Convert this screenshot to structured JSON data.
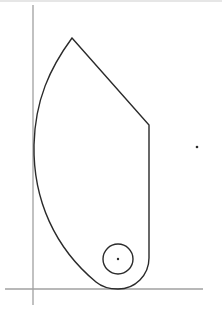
{
  "diagram": {
    "type": "cad-sketch",
    "size": {
      "width": 222,
      "height": 309
    },
    "colors": {
      "background": "#ffffff",
      "axis": "#a0a0a0",
      "geometry": "#2a2a2a",
      "frame": "#e6e6e6"
    },
    "axes": {
      "vertical": {
        "x": 33,
        "y1": 5,
        "y2": 305
      },
      "horizontal": {
        "y": 289,
        "x1": 5,
        "x2": 203
      }
    },
    "profile": {
      "apex": [
        72,
        38
      ],
      "right_line_end": [
        149,
        125
      ],
      "right_edge_bottom": [
        149,
        258
      ],
      "bottom_arc": {
        "center": [
          118,
          258
        ],
        "radius": 31
      },
      "left_arc_leftmost": [
        34,
        145
      ],
      "path": "M72,38 L149,125 L149,258 A31,31 0 0 1 118,289 C108,289 102,287 96,282 C55,248 33,200 34,145 C35,100 50,68 72,38 Z"
    },
    "hole": {
      "center": [
        118,
        259
      ],
      "radius": 15,
      "center_dot_radius": 1.2
    },
    "isolated_point": {
      "x": 197,
      "y": 147,
      "radius": 1.3
    }
  }
}
